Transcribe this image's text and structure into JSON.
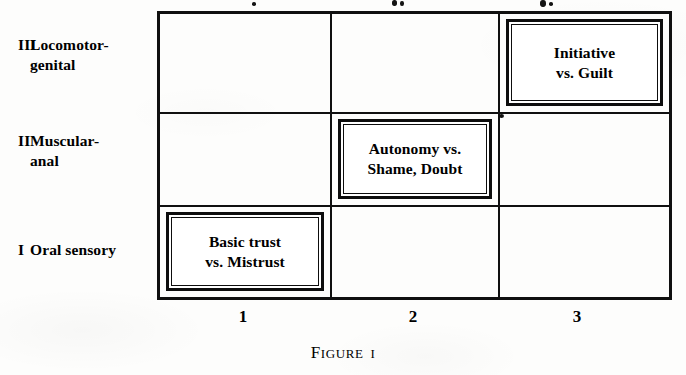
{
  "figure": {
    "caption_word": "Figure",
    "caption_number": "I",
    "rows": [
      {
        "numeral": "III",
        "name": "Locomotor-\ngenital"
      },
      {
        "numeral": "II",
        "name": "Muscular-\nanal"
      },
      {
        "numeral": "I",
        "name": "Oral sensory"
      }
    ],
    "columns": [
      {
        "number": "1"
      },
      {
        "number": "2"
      },
      {
        "number": "3"
      }
    ],
    "cells": [
      [
        {
          "text": ""
        },
        {
          "text": ""
        },
        {
          "text": "Initiative\nvs. Guilt"
        }
      ],
      [
        {
          "text": ""
        },
        {
          "text": "Autonomy vs.\nShame, Doubt"
        },
        {
          "text": ""
        }
      ],
      [
        {
          "text": "Basic trust\nvs. Mistrust"
        },
        {
          "text": ""
        },
        {
          "text": ""
        }
      ]
    ]
  },
  "chart_data": {
    "type": "table",
    "xlabel": "",
    "ylabel": "",
    "categories": [
      "1",
      "2",
      "3"
    ],
    "row_categories": [
      "III Locomotor-genital",
      "II Muscular-anal",
      "I Oral sensory"
    ],
    "annotations": [
      {
        "row": "III Locomotor-genital",
        "column": "3",
        "label": "Initiative vs. Guilt"
      },
      {
        "row": "II Muscular-anal",
        "column": "2",
        "label": "Autonomy vs. Shame, Doubt"
      },
      {
        "row": "I Oral sensory",
        "column": "1",
        "label": "Basic trust vs. Mistrust"
      }
    ]
  },
  "colors": {
    "ink": "#101010",
    "paper": "#fdfdfc"
  }
}
